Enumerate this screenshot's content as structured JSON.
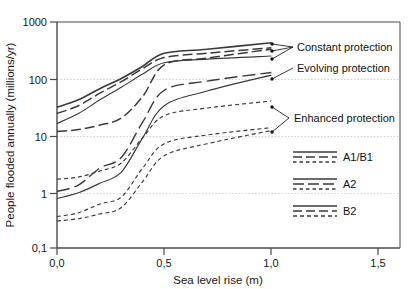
{
  "chart_data": {
    "type": "line",
    "title": "",
    "xlabel": "Sea level rise (m)",
    "ylabel": "People flooded annually (millions/yr)",
    "xlim": [
      0.0,
      1.6
    ],
    "ylim": [
      0.1,
      1000
    ],
    "yscale": "log",
    "xticks": [
      "0,0",
      "0,5",
      "1,0",
      "1,5"
    ],
    "xtick_values": [
      0.0,
      0.5,
      1.0,
      1.5
    ],
    "yticks": [
      "1000",
      "100",
      "10",
      "1",
      "0,1"
    ],
    "ytick_values": [
      1000,
      100,
      10,
      1,
      0.1
    ],
    "grid": "horizontal-dotted-at-100-10-1",
    "legend_position": "inside-lower-right",
    "x": [
      0.0,
      0.1,
      0.2,
      0.3,
      0.4,
      0.5,
      0.7,
      1.0
    ],
    "series": [
      {
        "name": "A1/B1 constant protection",
        "scenario": "A1/B1",
        "protection": "Constant protection",
        "style": "solid",
        "values": [
          16,
          24,
          42,
          70,
          120,
          190,
          220,
          250
        ]
      },
      {
        "name": "A2 constant protection",
        "scenario": "A2",
        "protection": "Constant protection",
        "style": "dashed",
        "values": [
          24,
          33,
          55,
          88,
          150,
          235,
          280,
          350
        ]
      },
      {
        "name": "B2 constant protection",
        "scenario": "B2",
        "protection": "Constant protection",
        "style": "solid-thick",
        "values": [
          31,
          42,
          66,
          100,
          165,
          280,
          330,
          430
        ]
      },
      {
        "name": "A1/B1 evolving protection",
        "scenario": "A1/B1",
        "protection": "Evolving protection",
        "style": "solid",
        "values": [
          0.75,
          0.95,
          1.4,
          2.2,
          9.0,
          33,
          60,
          115
        ]
      },
      {
        "name": "A2 evolving protection",
        "scenario": "A2",
        "protection": "Evolving protection",
        "style": "dashed",
        "values": [
          11.5,
          12.5,
          15,
          20,
          48,
          175,
          230,
          330
        ]
      },
      {
        "name": "B2 evolving protection",
        "scenario": "B2",
        "protection": "Evolving protection",
        "style": "dashed-long",
        "values": [
          1.0,
          1.3,
          2.6,
          4.0,
          17,
          62,
          90,
          128
        ]
      },
      {
        "name": "A1/B1 enhanced protection",
        "scenario": "A1/B1",
        "protection": "Enhanced protection",
        "style": "dotted",
        "values": [
          0.3,
          0.33,
          0.4,
          0.52,
          1.5,
          4.3,
          7.0,
          12
        ]
      },
      {
        "name": "A2 enhanced protection",
        "scenario": "A2",
        "protection": "Enhanced protection",
        "style": "dotted",
        "values": [
          1.65,
          1.8,
          2.3,
          3.2,
          9.0,
          22,
          30,
          40
        ]
      },
      {
        "name": "B2 enhanced protection",
        "scenario": "B2",
        "protection": "Enhanced protection",
        "style": "dotted",
        "values": [
          0.36,
          0.42,
          0.6,
          0.8,
          2.6,
          7.0,
          10,
          13.5
        ]
      }
    ],
    "annotations": [
      {
        "label": "Constant protection",
        "points": [
          1.0,
          1.0,
          1.0
        ],
        "point_values": [
          430,
          350,
          250
        ]
      },
      {
        "label": "Evolving protection",
        "points": [
          1.0
        ],
        "point_values": [
          128
        ]
      },
      {
        "label": "Enhanced protection",
        "points": [
          1.0,
          1.0
        ],
        "point_values": [
          40,
          13.5
        ]
      }
    ],
    "legend_entries": [
      {
        "label": "A1/B1",
        "styles": [
          "solid",
          "dashed",
          "dotted"
        ]
      },
      {
        "label": "A2",
        "styles": [
          "solid",
          "dashed",
          "dotted"
        ]
      },
      {
        "label": "B2",
        "styles": [
          "solid",
          "dashed",
          "dotted"
        ]
      }
    ]
  },
  "axes": {
    "xlabel": "Sea level rise (m)",
    "ylabel": "People flooded annually (millions/yr)"
  },
  "annotations": {
    "constant": "Constant protection",
    "evolving": "Evolving protection",
    "enhanced": "Enhanced protection"
  },
  "legend": {
    "item1": "A1/B1",
    "item2": "A2",
    "item3": "B2"
  },
  "xticks": {
    "t0": "0,0",
    "t1": "0,5",
    "t2": "1,0",
    "t3": "1,5"
  },
  "yticks": {
    "t0": "1000",
    "t1": "100",
    "t2": "10",
    "t3": "1",
    "t4": "0,1"
  },
  "colors": {
    "line": "#3a3a3a",
    "axis": "#555555",
    "grid": "#bdbdbd",
    "text": "#171717"
  }
}
